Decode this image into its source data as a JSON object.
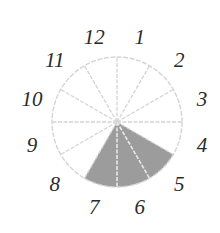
{
  "diagram": {
    "type": "clock-face-sector",
    "center": [
      117,
      122
    ],
    "radius": 65,
    "label_radius": 88,
    "sectors": 12,
    "labels": [
      "12",
      "1",
      "2",
      "3",
      "4",
      "5",
      "6",
      "7",
      "8",
      "9",
      "10",
      "11"
    ],
    "shaded_sectors": [
      "5",
      "6",
      "7"
    ],
    "shaded_from_deg": 120,
    "shaded_to_deg": 210,
    "colors": {
      "shade": "#9c9c9c",
      "lines": "#d4d4d4",
      "labels": "#2a2a2a",
      "background": "#ffffff"
    }
  }
}
